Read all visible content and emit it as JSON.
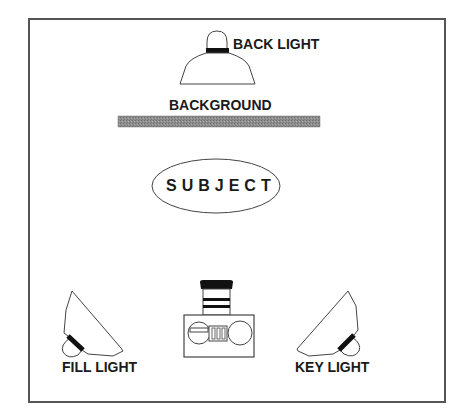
{
  "diagram": {
    "type": "studio-lighting-setup",
    "labels": {
      "back_light": "BACK LIGHT",
      "background": "BACKGROUND",
      "subject": "SUBJECT",
      "fill_light": "FILL LIGHT",
      "key_light": "KEY LIGHT"
    },
    "elements": [
      {
        "id": "back-light",
        "kind": "lamp",
        "position": "top-center"
      },
      {
        "id": "background",
        "kind": "backdrop",
        "position": "upper-center"
      },
      {
        "id": "subject",
        "kind": "ellipse",
        "position": "center"
      },
      {
        "id": "fill-light",
        "kind": "lamp",
        "position": "bottom-left"
      },
      {
        "id": "camera",
        "kind": "camera",
        "position": "bottom-center"
      },
      {
        "id": "key-light",
        "kind": "lamp",
        "position": "bottom-right"
      }
    ],
    "colors": {
      "frame": "#555555",
      "stroke": "#333333",
      "band": "#111111",
      "backdrop": "#8a8a8a",
      "text": "#1a1a1a"
    }
  }
}
